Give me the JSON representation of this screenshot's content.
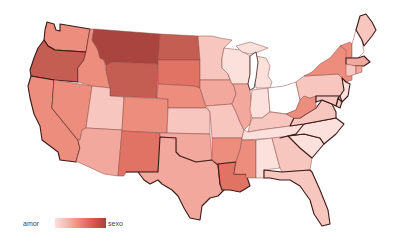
{
  "map": {
    "type": "choropleth",
    "region": "United States",
    "legend": {
      "left_label": "amor",
      "right_label": "sexo",
      "gradient": [
        "#fbe0dc",
        "#f6b5ab",
        "#ec8475",
        "#d9584a",
        "#a8403a"
      ]
    },
    "scale_colors": {
      "1": "#ffffff",
      "2": "#fbe0dc",
      "3": "#f7c6be",
      "4": "#f2a89c",
      "5": "#ec8d7e",
      "6": "#e07364",
      "7": "#c45d52",
      "8": "#a9453e"
    },
    "states": [
      {
        "id": "WA",
        "name": "Washington",
        "level": 5
      },
      {
        "id": "OR",
        "name": "Oregon",
        "level": 7
      },
      {
        "id": "CA",
        "name": "California",
        "level": 5
      },
      {
        "id": "NV",
        "name": "Nevada",
        "level": 5
      },
      {
        "id": "ID",
        "name": "Idaho",
        "level": 5
      },
      {
        "id": "MT",
        "name": "Montana",
        "level": 8
      },
      {
        "id": "WY",
        "name": "Wyoming",
        "level": 7
      },
      {
        "id": "UT",
        "name": "Utah",
        "level": 3
      },
      {
        "id": "AZ",
        "name": "Arizona",
        "level": 4
      },
      {
        "id": "CO",
        "name": "Colorado",
        "level": 5
      },
      {
        "id": "NM",
        "name": "New Mexico",
        "level": 6
      },
      {
        "id": "ND",
        "name": "North Dakota",
        "level": 7
      },
      {
        "id": "SD",
        "name": "South Dakota",
        "level": 6
      },
      {
        "id": "NE",
        "name": "Nebraska",
        "level": 5
      },
      {
        "id": "KS",
        "name": "Kansas",
        "level": 3
      },
      {
        "id": "OK",
        "name": "Oklahoma",
        "level": 4
      },
      {
        "id": "TX",
        "name": "Texas",
        "level": 4
      },
      {
        "id": "MN",
        "name": "Minnesota",
        "level": 3
      },
      {
        "id": "IA",
        "name": "Iowa",
        "level": 4
      },
      {
        "id": "MO",
        "name": "Missouri",
        "level": 3
      },
      {
        "id": "AR",
        "name": "Arkansas",
        "level": 5
      },
      {
        "id": "LA",
        "name": "Louisiana",
        "level": 6
      },
      {
        "id": "WI",
        "name": "Wisconsin",
        "level": 2
      },
      {
        "id": "IL",
        "name": "Illinois",
        "level": 4
      },
      {
        "id": "MI",
        "name": "Michigan",
        "level": 2
      },
      {
        "id": "IN",
        "name": "Indiana",
        "level": 2
      },
      {
        "id": "OH",
        "name": "Ohio",
        "level": 1
      },
      {
        "id": "KY",
        "name": "Kentucky",
        "level": 3
      },
      {
        "id": "TN",
        "name": "Tennessee",
        "level": 2
      },
      {
        "id": "MS",
        "name": "Mississippi",
        "level": 5
      },
      {
        "id": "AL",
        "name": "Alabama",
        "level": 2
      },
      {
        "id": "GA",
        "name": "Georgia",
        "level": 3
      },
      {
        "id": "FL",
        "name": "Florida",
        "level": 3
      },
      {
        "id": "SC",
        "name": "South Carolina",
        "level": 2
      },
      {
        "id": "NC",
        "name": "North Carolina",
        "level": 2
      },
      {
        "id": "VA",
        "name": "Virginia",
        "level": 3
      },
      {
        "id": "WV",
        "name": "West Virginia",
        "level": 5
      },
      {
        "id": "PA",
        "name": "Pennsylvania",
        "level": 3
      },
      {
        "id": "NY",
        "name": "New York",
        "level": 5
      },
      {
        "id": "VT",
        "name": "Vermont",
        "level": 5
      },
      {
        "id": "NH",
        "name": "New Hampshire",
        "level": 1
      },
      {
        "id": "ME",
        "name": "Maine",
        "level": 3
      },
      {
        "id": "MA",
        "name": "Massachusetts",
        "level": 4
      },
      {
        "id": "CT",
        "name": "Connecticut",
        "level": 3
      },
      {
        "id": "RI",
        "name": "Rhode Island",
        "level": 4
      },
      {
        "id": "NJ",
        "name": "New Jersey",
        "level": 2
      },
      {
        "id": "DE",
        "name": "Delaware",
        "level": 3
      },
      {
        "id": "MD",
        "name": "Maryland",
        "level": 3
      }
    ]
  }
}
